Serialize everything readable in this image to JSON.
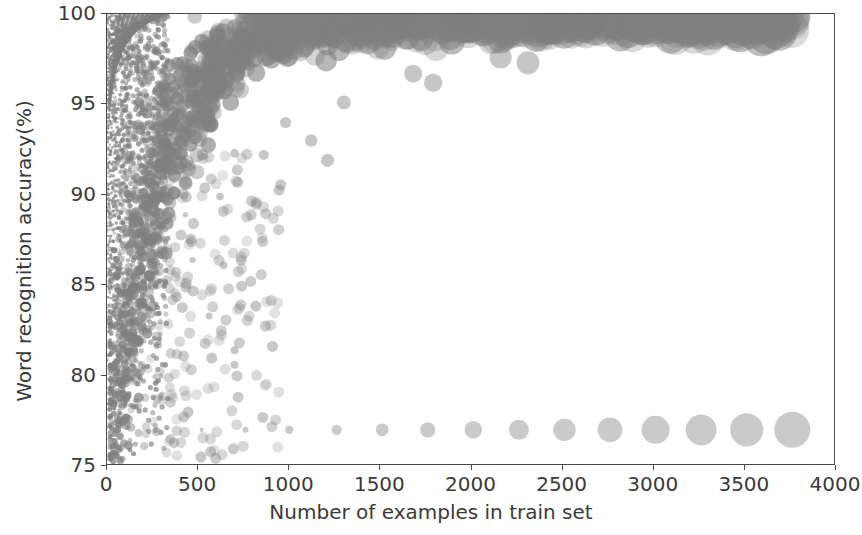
{
  "chart_data": {
    "type": "scatter",
    "title": "",
    "xlabel": "Number of examples in train set",
    "ylabel": "Word recognition accuracy(%)",
    "xlim": [
      0,
      4000
    ],
    "ylim": [
      75,
      100
    ],
    "xticks": [
      0,
      500,
      1000,
      1500,
      2000,
      2500,
      3000,
      3500,
      4000
    ],
    "yticks": [
      75,
      80,
      85,
      90,
      95,
      100
    ],
    "xtick_labels": [
      "0",
      "500",
      "1000",
      "1500",
      "2000",
      "2500",
      "3000",
      "3500",
      "4000"
    ],
    "ytick_labels": [
      "75",
      "80",
      "85",
      "90",
      "95",
      "100"
    ],
    "grid": false,
    "legend": null,
    "marker": {
      "shape": "circle",
      "color": "#808080",
      "alpha": 0.45,
      "size_encodes": "number of examples in train set",
      "size_range_px": [
        1.5,
        18
      ]
    },
    "series": [
      {
        "name": "flat-band",
        "comment": "horizontal row of evenly spaced markers at ~77% accuracy",
        "points": [
          {
            "x": 520,
            "y": 77.0,
            "r": 2.2
          },
          {
            "x": 760,
            "y": 77.0,
            "r": 3.0
          },
          {
            "x": 1000,
            "y": 77.0,
            "r": 4.2
          },
          {
            "x": 1260,
            "y": 77.0,
            "r": 5.2
          },
          {
            "x": 1510,
            "y": 77.0,
            "r": 6.4
          },
          {
            "x": 1760,
            "y": 77.0,
            "r": 7.6
          },
          {
            "x": 2010,
            "y": 77.0,
            "r": 8.8
          },
          {
            "x": 2260,
            "y": 77.0,
            "r": 10.0
          },
          {
            "x": 2510,
            "y": 77.0,
            "r": 11.2
          },
          {
            "x": 2760,
            "y": 77.0,
            "r": 12.4
          },
          {
            "x": 3010,
            "y": 77.0,
            "r": 14.0
          },
          {
            "x": 3260,
            "y": 77.0,
            "r": 15.4
          },
          {
            "x": 3510,
            "y": 77.0,
            "r": 16.6
          },
          {
            "x": 3760,
            "y": 77.0,
            "r": 18.0
          }
        ]
      },
      {
        "name": "high-accuracy-outliers",
        "comment": "large isolated markers near 100% at high x",
        "points": [
          {
            "x": 3030,
            "y": 99.7,
            "r": 14.5
          },
          {
            "x": 3440,
            "y": 99.7,
            "r": 16.0
          },
          {
            "x": 2160,
            "y": 97.6,
            "r": 11.0
          },
          {
            "x": 2310,
            "y": 97.3,
            "r": 11.5
          },
          {
            "x": 1930,
            "y": 99.2,
            "r": 10.0
          },
          {
            "x": 2060,
            "y": 99.6,
            "r": 10.5
          },
          {
            "x": 1790,
            "y": 96.2,
            "r": 9.2
          },
          {
            "x": 1680,
            "y": 96.7,
            "r": 9.0
          },
          {
            "x": 1300,
            "y": 95.1,
            "r": 7.0
          },
          {
            "x": 1120,
            "y": 93.0,
            "r": 6.2
          },
          {
            "x": 1210,
            "y": 91.9,
            "r": 6.6
          },
          {
            "x": 980,
            "y": 94.0,
            "r": 5.6
          },
          {
            "x": 860,
            "y": 92.2,
            "r": 5.0
          },
          {
            "x": 700,
            "y": 92.3,
            "r": 4.2
          },
          {
            "x": 620,
            "y": 89.9,
            "r": 3.8
          },
          {
            "x": 640,
            "y": 86.1,
            "r": 3.8
          },
          {
            "x": 700,
            "y": 81.4,
            "r": 4.0
          },
          {
            "x": 700,
            "y": 80.6,
            "r": 4.0
          },
          {
            "x": 560,
            "y": 83.3,
            "r": 3.4
          },
          {
            "x": 470,
            "y": 86.4,
            "r": 3.0
          },
          {
            "x": 430,
            "y": 88.9,
            "r": 2.6
          }
        ]
      }
    ]
  },
  "figure": {
    "frame_color": "#4a4a4a",
    "background": "#ffffff",
    "text_color": "#3a3a3a"
  }
}
